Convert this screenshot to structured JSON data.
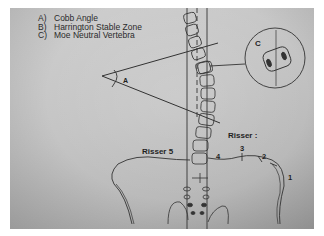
{
  "legend": {
    "items": [
      {
        "key": "A)",
        "label": "Cobb Angle"
      },
      {
        "key": "B)",
        "label": "Harrington Stable Zone"
      },
      {
        "key": "C)",
        "label": "Moe Neutral Vertebra"
      }
    ]
  },
  "labels": {
    "angle": "A",
    "inset": "C",
    "risser5": "Risser 5",
    "risser": "Risser :",
    "stages": [
      "4",
      "3",
      "2",
      "1"
    ]
  },
  "colors": {
    "paper": "#c6c6c6",
    "ink": "#2a2a2a",
    "border": "#ffffff"
  }
}
